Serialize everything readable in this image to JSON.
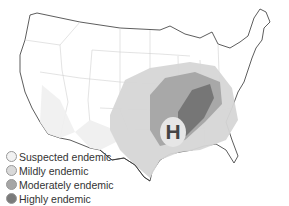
{
  "map": {
    "subject": "United States endemic regions map",
    "marker": {
      "label": "H"
    },
    "colors": {
      "suspected": "#f2f2f2",
      "mild": "#d9d9d9",
      "moderate": "#a6a6a6",
      "high": "#7a7a7a",
      "border": "#333333",
      "state_lines": "#c8c8c8"
    }
  },
  "legend": {
    "items": [
      {
        "label": "Suspected endemic",
        "color": "#f2f2f2"
      },
      {
        "label": "Mildly endemic",
        "color": "#d9d9d9"
      },
      {
        "label": "Moderately endemic",
        "color": "#a6a6a6"
      },
      {
        "label": "Highly endemic",
        "color": "#7a7a7a"
      }
    ]
  }
}
